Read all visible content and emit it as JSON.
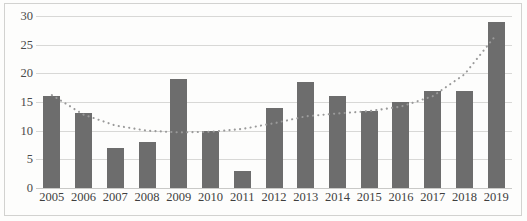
{
  "chart_data": {
    "type": "bar",
    "title": "",
    "subtitle": "",
    "xlabel": "",
    "ylabel": "",
    "categories": [
      "2005",
      "2006",
      "2007",
      "2008",
      "2009",
      "2010",
      "2011",
      "2012",
      "2013",
      "2014",
      "2015",
      "2016",
      "2017",
      "2018",
      "2019"
    ],
    "values": [
      16,
      13,
      7,
      8,
      19,
      10,
      3,
      14,
      18.5,
      16,
      13.5,
      15,
      17,
      17,
      29
    ],
    "ylim": [
      0,
      30
    ],
    "ytick_values": [
      0,
      5,
      10,
      15,
      20,
      25,
      30
    ],
    "ytick_labels": [
      "0",
      "5",
      "10",
      "15",
      "20",
      "25",
      "30"
    ],
    "grid": true,
    "legend": "none",
    "series": [
      {
        "name": "bars",
        "type": "bar",
        "color": "#6d6d6d",
        "values": [
          16,
          13,
          7,
          8,
          19,
          10,
          3,
          14,
          18.5,
          16,
          13.5,
          15,
          17,
          17,
          29
        ]
      },
      {
        "name": "trendline",
        "type": "line",
        "style": "dotted",
        "color": "#9a9a9a",
        "values": [
          16.2,
          12.8,
          10.9,
          10.0,
          9.7,
          9.8,
          10.3,
          11.3,
          12.5,
          13.0,
          13.4,
          14.2,
          16.0,
          19.8,
          26.7
        ]
      }
    ]
  },
  "colors": {
    "bar": "#6d6d6d",
    "trendline": "#9a9a9a",
    "gridline": "#d8d8d6",
    "border": "#d2d2d0",
    "background": "#fdfdfc",
    "tick_text": "#4a4a4a"
  }
}
